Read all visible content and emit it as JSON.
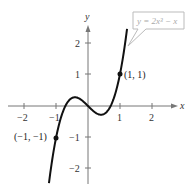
{
  "chart_data": {
    "type": "line",
    "title": "",
    "xlabel": "x",
    "ylabel": "y",
    "xlim": [
      -2.5,
      2.5
    ],
    "ylim": [
      -2.5,
      2.5
    ],
    "x_ticks": [
      "-2",
      "-1",
      "1",
      "2"
    ],
    "y_ticks": [
      "2",
      "1",
      "-1",
      "-2"
    ],
    "grid": false,
    "series": [
      {
        "name": "y = 2x^3 - x",
        "function": "2x^3 - x",
        "x_range": [
          -1.22,
          1.22
        ]
      }
    ],
    "annotations": [
      {
        "label": "(1, 1)",
        "x": 1,
        "y": 1
      },
      {
        "label": "(-1, -1)",
        "x": -1,
        "y": -1
      }
    ],
    "legend": {
      "text": "y = 2x³ − x",
      "position": "top-right callout"
    }
  },
  "labels": {
    "x_axis": "x",
    "y_axis": "y",
    "equation": "y = 2x³ − x",
    "point_a": "(1, 1)",
    "point_b": "(−1, −1)",
    "tick_x_m2": "−2",
    "tick_x_m1": "−1",
    "tick_x_1": "1",
    "tick_x_2": "2",
    "tick_y_2": "2",
    "tick_y_1": "1",
    "tick_y_m1": "−1",
    "tick_y_m2": "−2"
  }
}
